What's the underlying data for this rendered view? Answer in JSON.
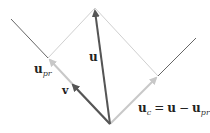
{
  "diagram": {
    "type": "vector-projection",
    "colors": {
      "dark_vector": "#555555",
      "light_vector": "#c8c8c8",
      "line": "#666666",
      "text": "#222222"
    },
    "labels": {
      "u": "u",
      "v": "v",
      "u_pr_main": "u",
      "u_pr_sub": "pr",
      "u_c_main": "u",
      "u_c_sub": "c",
      "u_c_eq": "=",
      "u_c_rhs_u": "u",
      "u_c_minus": "−",
      "u_c_rhs_upr_main": "u",
      "u_c_rhs_upr_sub": "pr"
    },
    "points": {
      "origin": [
        110,
        124
      ],
      "u_tip": [
        95,
        8
      ],
      "u_pr_tip": [
        48,
        58
      ],
      "u_c_tip": [
        158,
        76
      ],
      "v_tip": [
        71,
        83
      ],
      "left_line_end": [
        11,
        19
      ],
      "right_line_end": [
        196,
        38
      ]
    }
  }
}
